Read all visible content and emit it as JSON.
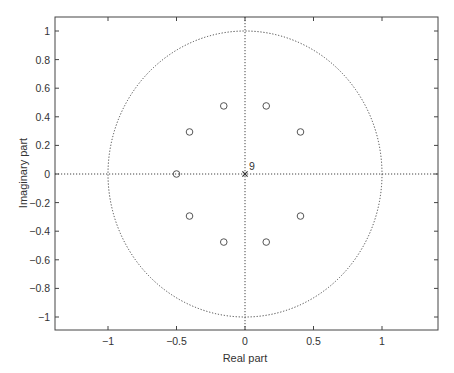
{
  "chart_data": {
    "type": "scatter",
    "title": "",
    "subtitle": "Pole-zero plot",
    "xlabel": "Real part",
    "ylabel": "Imaginary part",
    "xlim": [
      -1.4,
      1.4
    ],
    "ylim": [
      -1.1,
      1.1
    ],
    "grid": false,
    "xticks": [
      -1,
      -0.5,
      0,
      0.5,
      1
    ],
    "xtick_labels": [
      "−1",
      "−0.5",
      "0",
      "0.5",
      "1"
    ],
    "yticks": [
      1,
      0.8,
      0.6,
      0.4,
      0.2,
      0,
      -0.2,
      -0.4,
      -0.6,
      -0.8,
      -1
    ],
    "ytick_labels": [
      "1",
      "0.8",
      "0.6",
      "0.4",
      "0.2",
      "0",
      "−0.2",
      "−0.4",
      "−0.6",
      "−0.8",
      "−1"
    ],
    "unit_circle": {
      "center": [
        0,
        0
      ],
      "radius": 1,
      "style": "dotted"
    },
    "series": [
      {
        "name": "zeros",
        "marker": "o",
        "points": [
          [
            -0.5,
            0
          ],
          [
            -0.405,
            0.294
          ],
          [
            -0.155,
            0.476
          ],
          [
            0.155,
            0.476
          ],
          [
            0.405,
            0.294
          ],
          [
            -0.405,
            -0.294
          ],
          [
            -0.155,
            -0.476
          ],
          [
            0.155,
            -0.476
          ],
          [
            0.405,
            -0.294
          ]
        ]
      },
      {
        "name": "poles",
        "marker": "x",
        "points": [
          [
            0,
            0
          ]
        ],
        "multiplicity_label": "9"
      }
    ],
    "annotations": [
      {
        "text": "9",
        "x": 0.02,
        "y": 0.04
      }
    ]
  }
}
